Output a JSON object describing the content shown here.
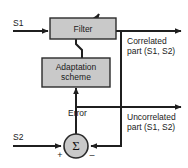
{
  "figure": {
    "type": "block-diagram",
    "colors": {
      "block_fill": "#c9c9c9",
      "block_stroke": "#2b2b2b",
      "line": "#1f1f1f",
      "text": "#1a1a1a",
      "background": "#ffffff"
    }
  },
  "blocks": [
    {
      "id": "filter",
      "label": "Filter",
      "shape": "rect"
    },
    {
      "id": "adaptation",
      "label_line1": "Adaptation",
      "label_line2": "scheme",
      "shape": "rect"
    },
    {
      "id": "summer",
      "label": "Σ",
      "shape": "circle"
    }
  ],
  "inputs": [
    {
      "id": "s1",
      "label": "S1"
    },
    {
      "id": "s2",
      "label": "S2"
    }
  ],
  "outputs": [
    {
      "id": "correlated",
      "line1": "Correlated",
      "line2": "part (S1, S2)"
    },
    {
      "id": "uncorrelated",
      "line1": "Uncorrelated",
      "line2": "part (S1, S2)"
    }
  ],
  "signals": [
    {
      "id": "error",
      "label": "Error"
    }
  ],
  "signs": [
    {
      "id": "plus-sign",
      "label": "+"
    },
    {
      "id": "minus-sign",
      "label": "–"
    }
  ]
}
